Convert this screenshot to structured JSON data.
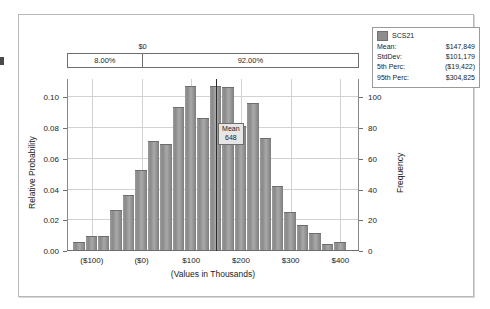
{
  "legend": {
    "series_name": "SCS21",
    "swatch_color": "#8d8d8d",
    "rows": [
      {
        "key": "Mean:",
        "value": "$147,849"
      },
      {
        "key": "StdDev:",
        "value": "$101,179"
      },
      {
        "key": "5th Perc:",
        "value": "($19,422)"
      },
      {
        "key": "95th Perc:",
        "value": "$304,825"
      }
    ]
  },
  "certainty_band": {
    "zero_marker_label": "$0",
    "left_percent": "8.00%",
    "right_percent": "92.00%"
  },
  "mean_marker": {
    "label": "Mean",
    "value": "648"
  },
  "chart_data": {
    "type": "bar",
    "title": "",
    "subtitle": "",
    "xlabel": "(Values in Thousands)",
    "ylabel": "Relative Probability",
    "ylabel_right": "Frequency",
    "grid": true,
    "legend_position": "top-right",
    "xlim": [
      -150,
      437.5
    ],
    "ylim": [
      0.0,
      0.112
    ],
    "ylim_right": [
      0,
      112
    ],
    "xticks": [
      -100,
      0,
      100,
      200,
      300,
      400
    ],
    "xtick_labels": [
      "($100)",
      "($0)",
      "$100",
      "$200",
      "$300",
      "$400"
    ],
    "yticks": [
      0.0,
      0.02,
      0.04,
      0.06,
      0.08,
      0.1
    ],
    "ytick_labels": [
      "0.00",
      "0.02",
      "0.04",
      "0.06",
      "0.08",
      "0.10"
    ],
    "yticks_right": [
      0,
      20,
      40,
      60,
      80,
      100
    ],
    "ytick_labels_right": [
      "0",
      "20",
      "40",
      "60",
      "80",
      "100"
    ],
    "bin_width": 25,
    "bin_starts": [
      -137.5,
      -112.5,
      -87.5,
      -62.5,
      -37.5,
      -12.5,
      12.5,
      37.5,
      62.5,
      87.5,
      112.5,
      137.5,
      162.5,
      187.5,
      212.5,
      237.5,
      262.5,
      287.5,
      312.5,
      337.5,
      362.5,
      387.5
    ],
    "values": [
      0.005,
      0.009,
      0.009,
      0.026,
      0.036,
      0.052,
      0.071,
      0.069,
      0.093,
      0.107,
      0.086,
      0.107,
      0.106,
      0.081,
      0.096,
      0.073,
      0.042,
      0.025,
      0.016,
      0.011,
      0.004,
      0.005
    ],
    "frequencies": [
      5,
      9,
      9,
      26,
      36,
      52,
      71,
      69,
      93,
      107,
      86,
      107,
      106,
      81,
      96,
      73,
      42,
      25,
      16,
      11,
      4,
      5
    ]
  }
}
